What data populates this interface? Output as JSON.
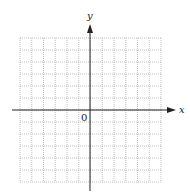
{
  "diagram": {
    "type": "coordinate-grid",
    "x_axis_label": "x",
    "y_axis_label": "y",
    "origin_label": "0",
    "grid": {
      "columns": 12,
      "rows": 12,
      "left": 20,
      "top": 38,
      "right": 161,
      "bottom": 182,
      "line_color": "#b0b0b0",
      "line_style": "dotted"
    },
    "axes": {
      "origin_px": [
        90,
        110
      ],
      "x_start": 12,
      "x_end": 176,
      "y_start": 191,
      "y_end": 24,
      "color": "#222222"
    }
  }
}
